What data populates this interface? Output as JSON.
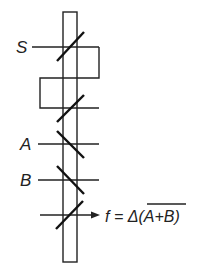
{
  "diagram": {
    "title": "",
    "inputs": [
      {
        "id": "S",
        "label": "S"
      },
      {
        "id": "A",
        "label": "A"
      },
      {
        "id": "B",
        "label": "B"
      }
    ],
    "output": {
      "label_prefix": "f = Δ(",
      "label_overbar": "A+B",
      "label_suffix": ")",
      "full": "f = Δ(A+B) with overbar on A+B"
    },
    "colors": {
      "ink": "#222222",
      "background": "#ffffff"
    }
  }
}
